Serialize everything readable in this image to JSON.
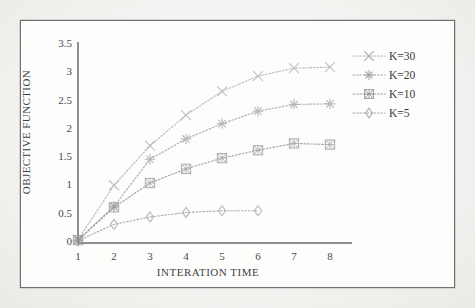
{
  "chart_data": {
    "type": "line",
    "title": "",
    "xlabel": "INTERATION TIME",
    "ylabel": "OBJECTIVE FUNCTION",
    "x": [
      1,
      2,
      3,
      4,
      5,
      6,
      7,
      8
    ],
    "xlim": [
      1,
      8
    ],
    "ylim": [
      0,
      3.5
    ],
    "yticks": [
      "0",
      "0.5",
      "1",
      "1.5",
      "2",
      "2.5",
      "3",
      "3.5"
    ],
    "ytick_values": [
      0,
      0.5,
      1,
      1.5,
      2,
      2.5,
      3,
      3.5
    ],
    "xticks": [
      "1",
      "2",
      "3",
      "4",
      "5",
      "6",
      "7",
      "8"
    ],
    "grid": false,
    "legend_position": "right",
    "series": [
      {
        "name": "K=30",
        "marker": "cross",
        "color": "#a9a9ad",
        "x": [
          1,
          2,
          3,
          4,
          5,
          6,
          7,
          8
        ],
        "values": [
          0.06,
          1.02,
          1.72,
          2.26,
          2.68,
          2.95,
          3.09,
          3.11
        ]
      },
      {
        "name": "K=20",
        "marker": "star",
        "color": "#9b9ba0",
        "x": [
          1,
          2,
          3,
          4,
          5,
          6,
          7,
          8
        ],
        "values": [
          0.05,
          0.65,
          1.48,
          1.84,
          2.11,
          2.33,
          2.45,
          2.46
        ]
      },
      {
        "name": "K=10",
        "marker": "square-hatch",
        "color": "#8d8d92",
        "x": [
          1,
          2,
          3,
          4,
          5,
          6,
          7,
          8
        ],
        "values": [
          0.05,
          0.63,
          1.06,
          1.31,
          1.5,
          1.64,
          1.76,
          1.74
        ]
      },
      {
        "name": "K=5",
        "marker": "diamond",
        "color": "#9a9a9e",
        "x": [
          1,
          2,
          3,
          4,
          5,
          6
        ],
        "values": [
          0.04,
          0.33,
          0.46,
          0.54,
          0.57,
          0.57
        ]
      }
    ]
  },
  "legend": {
    "items": [
      {
        "label": "K=30"
      },
      {
        "label": "K=20"
      },
      {
        "label": "K=10"
      },
      {
        "label": "K=5"
      }
    ]
  },
  "colors": {
    "axis": "#6a6a6c",
    "frame": "#6f6f70",
    "paper": "#fdfdfc",
    "text": "#3e3e40"
  }
}
